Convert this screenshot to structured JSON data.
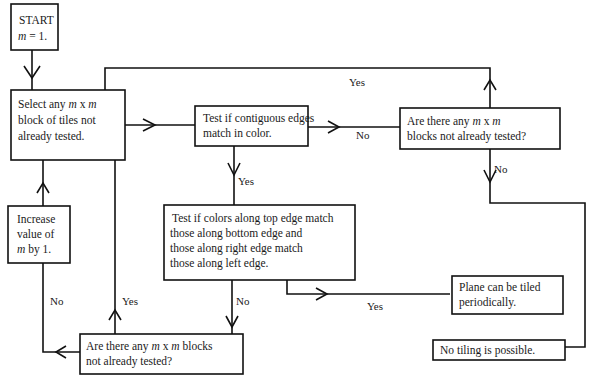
{
  "diagram": {
    "nodes": {
      "start": {
        "line1": "START",
        "line2_var": "m",
        "line2_rest": " = 1."
      },
      "select": {
        "line1_a": "Select any ",
        "line1_m1": "m",
        "line1_x": " x ",
        "line1_m2": "m",
        "line2": "block of tiles not",
        "line3": "already tested."
      },
      "test_contiguous": {
        "line1": "Test if contiguous edges",
        "line2": "match in color."
      },
      "any_blocks_top": {
        "line1_a": "Are there any ",
        "line1_m1": "m",
        "line1_x": " x ",
        "line1_m2": "m",
        "line2": "blocks not already tested?"
      },
      "increase": {
        "line1": "Increase",
        "line2": "value of",
        "line3_var": "m",
        "line3_rest": " by 1."
      },
      "test_edges": {
        "line1": "Test  if colors along top edge match",
        "line2": "those along bottom edge and",
        "line3": "those along right edge match",
        "line4": "those along left edge."
      },
      "any_blocks_bottom": {
        "line1_a": "Are there any ",
        "line1_m1": "m",
        "line1_x": " x ",
        "line1_m2": "m",
        "line1_b": " blocks",
        "line2": "not already tested?"
      },
      "plane_tiled": {
        "line1": "Plane can be tiled",
        "line2": "periodically."
      },
      "no_tiling": {
        "line1": "No tiling is possible."
      }
    },
    "edge_labels": {
      "top_yes": "Yes",
      "contiguous_no": "No",
      "contiguous_yes": "Yes",
      "top_blocks_no": "No",
      "increase_no": "No",
      "bottom_yes": "Yes",
      "edges_no": "No",
      "edges_yes": "Yes"
    },
    "colors": {
      "stroke": "#111111",
      "text": "#1a1a1a",
      "background": "#ffffff"
    }
  }
}
